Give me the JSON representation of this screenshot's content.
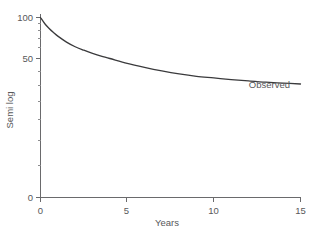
{
  "chart_data": {
    "type": "line",
    "title": "",
    "xlabel": "Years",
    "ylabel": "Semi log",
    "xlim": [
      0,
      15
    ],
    "ylim": [
      0,
      100
    ],
    "yscale": "log-like (semi log)",
    "grid": false,
    "legend": "inline annotation at curve end",
    "xticks": [
      0,
      5,
      10,
      15
    ],
    "xticklabels": [
      "0",
      "5",
      "10",
      "15"
    ],
    "yticks": [
      0,
      50,
      100
    ],
    "yticklabels": [
      "0",
      "50",
      "100"
    ],
    "yminorticks": [
      90,
      80,
      70,
      60,
      45,
      40,
      35,
      30,
      25,
      20,
      15,
      10
    ],
    "series": [
      {
        "name": "Observed",
        "annotation": "Observed",
        "x": [
          0,
          0.25,
          0.5,
          0.75,
          1,
          1.5,
          2,
          2.5,
          3,
          3.5,
          4,
          5,
          6,
          7,
          8,
          9,
          10,
          11,
          12,
          13,
          14,
          15
        ],
        "values": [
          100,
          90,
          83,
          77.5,
          73,
          66,
          61,
          57.5,
          54.5,
          52,
          50,
          46,
          43,
          40.5,
          38.5,
          37,
          36,
          35,
          34.2,
          33.5,
          33,
          32.5
        ]
      }
    ]
  },
  "axes": {
    "x": {
      "label": "Years",
      "ticks": [
        {
          "value": "0"
        },
        {
          "value": "5"
        },
        {
          "value": "10"
        },
        {
          "value": "15"
        }
      ]
    },
    "y": {
      "label": "Semi log",
      "ticks": [
        {
          "value": "100"
        },
        {
          "value": "50"
        },
        {
          "value": "0"
        }
      ]
    }
  },
  "annotations": {
    "observed": "Observed"
  },
  "colors": {
    "background": "#ffffff",
    "curve": "#3a3a3c",
    "axis": "#6a6a6c",
    "text": "#58585a"
  }
}
